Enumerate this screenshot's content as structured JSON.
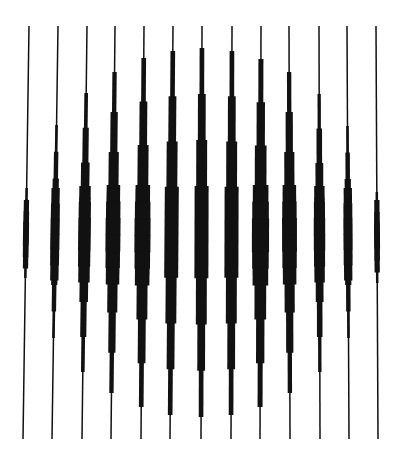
{
  "colors": {
    "background": "#ffffff",
    "ink": "#111111"
  },
  "chart_data": {
    "type": "diagram",
    "canvas": {
      "width": 402,
      "height": 457
    },
    "y_top": 26,
    "y_bottom": 439,
    "y_center": 232,
    "thin_width": 1.5,
    "lines": [
      {
        "x_top": 29,
        "x_bot": 23,
        "thick_top": 188,
        "thick_bot": 278,
        "max_w": 5,
        "bulge_top": 200,
        "bulge_bot": 268
      },
      {
        "x_top": 58,
        "x_bot": 52,
        "thick_top": 125,
        "thick_bot": 338,
        "max_w": 8,
        "bulge_top": 188,
        "bulge_bot": 280
      },
      {
        "x_top": 87,
        "x_bot": 82,
        "thick_top": 93,
        "thick_bot": 372,
        "max_w": 11,
        "bulge_top": 186,
        "bulge_bot": 282
      },
      {
        "x_top": 115,
        "x_bot": 111,
        "thick_top": 72,
        "thick_bot": 393,
        "max_w": 13,
        "bulge_top": 185,
        "bulge_bot": 284
      },
      {
        "x_top": 144,
        "x_bot": 141,
        "thick_top": 58,
        "thick_bot": 407,
        "max_w": 14,
        "bulge_top": 185,
        "bulge_bot": 285
      },
      {
        "x_top": 173,
        "x_bot": 170,
        "thick_top": 51,
        "thick_bot": 415,
        "max_w": 14,
        "bulge_top": 0,
        "bulge_bot": 0
      },
      {
        "x_top": 202,
        "x_bot": 201,
        "thick_top": 48,
        "thick_bot": 417,
        "max_w": 14,
        "bulge_top": 0,
        "bulge_bot": 0
      },
      {
        "x_top": 232,
        "x_bot": 231,
        "thick_top": 51,
        "thick_bot": 415,
        "max_w": 14,
        "bulge_top": 0,
        "bulge_bot": 0
      },
      {
        "x_top": 261,
        "x_bot": 260,
        "thick_top": 59,
        "thick_bot": 407,
        "max_w": 15,
        "bulge_top": 185,
        "bulge_bot": 285
      },
      {
        "x_top": 289,
        "x_bot": 290,
        "thick_top": 72,
        "thick_bot": 393,
        "max_w": 13,
        "bulge_top": 185,
        "bulge_bot": 284
      },
      {
        "x_top": 319,
        "x_bot": 320,
        "thick_top": 94,
        "thick_bot": 372,
        "max_w": 10,
        "bulge_top": 186,
        "bulge_bot": 282
      },
      {
        "x_top": 347,
        "x_bot": 349,
        "thick_top": 126,
        "thick_bot": 338,
        "max_w": 8,
        "bulge_top": 188,
        "bulge_bot": 280
      },
      {
        "x_top": 376,
        "x_bot": 378,
        "thick_top": 192,
        "thick_bot": 283,
        "max_w": 5,
        "bulge_top": 200,
        "bulge_bot": 272
      }
    ],
    "steps_per_side": 4
  }
}
